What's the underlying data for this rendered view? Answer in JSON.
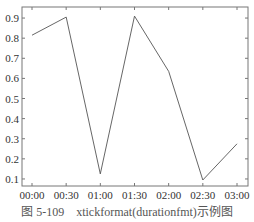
{
  "chart_data": {
    "type": "line",
    "title": "",
    "xlabel": "",
    "ylabel": "",
    "x": [
      "00:00",
      "00:30",
      "01:00",
      "01:30",
      "02:00",
      "02:30",
      "03:00"
    ],
    "series": [
      {
        "name": "data",
        "values": [
          0.815,
          0.905,
          0.125,
          0.91,
          0.635,
          0.095,
          0.275
        ],
        "color": "#555555"
      }
    ],
    "xticks": [
      "00:00",
      "00:30",
      "01:00",
      "01:30",
      "02:00",
      "02:30",
      "03:00"
    ],
    "yticks": [
      0.1,
      0.2,
      0.3,
      0.4,
      0.5,
      0.6,
      0.7,
      0.8,
      0.9
    ],
    "ytick_labels": [
      "0.1",
      "0.2",
      "0.3",
      "0.4",
      "0.5",
      "0.6",
      "0.7",
      "0.8",
      "0.9"
    ],
    "ylim": [
      0.065,
      0.955
    ],
    "grid": false,
    "legend": null
  },
  "caption": {
    "figure_number": "图 5-109",
    "text": "xtickformat(durationfmt)示例图"
  }
}
